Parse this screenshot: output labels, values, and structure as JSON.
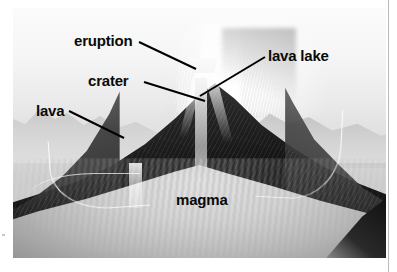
{
  "diagram": {
    "labels": [
      {
        "id": "eruption",
        "text": "eruption"
      },
      {
        "id": "crater",
        "text": "crater"
      },
      {
        "id": "lava_lake",
        "text": "lava lake"
      },
      {
        "id": "lava",
        "text": "lava"
      },
      {
        "id": "magma",
        "text": "magma"
      }
    ],
    "leaders": [
      {
        "id": "eruption",
        "from": [
          139,
          42
        ],
        "to": [
          196,
          69
        ]
      },
      {
        "id": "crater",
        "from": [
          144,
          82
        ],
        "to": [
          205,
          101
        ]
      },
      {
        "id": "lava_lake",
        "from": [
          265,
          57
        ],
        "to": [
          200,
          96
        ]
      },
      {
        "id": "lava",
        "from": [
          69,
          111
        ],
        "to": [
          124,
          138
        ]
      }
    ],
    "colors": {
      "label_text": "#0a0a0a",
      "leader_line": "#000000",
      "page_background": "#ffffff",
      "photo_sky": "#f2f2f2",
      "photo_cone": "#161616",
      "photo_magma": "#cfcfcf",
      "rule": "#b9b9b9"
    }
  }
}
